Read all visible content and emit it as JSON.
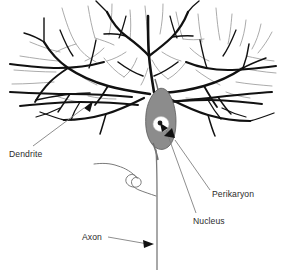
{
  "figure": {
    "background_color": "#ffffff",
    "ink_color": "#111111",
    "secondary_ink_color": "#9a9a9a",
    "soma_fill_color": "#8c8c8c",
    "soma_stroke_color": "#4a4a4a",
    "nucleus_fill_color": "#ffffff",
    "nucleolus_color": "#1a1a1a",
    "leader_line_color": "#707070",
    "label_color": "#2b2b2b"
  },
  "labels": [
    {
      "id": "dendrite",
      "text": "Dendrite",
      "x": 9,
      "y": 157,
      "anchor": "start",
      "points_to": "dendrite-branch"
    },
    {
      "id": "perikaryon",
      "text": "Perikaryon",
      "x": 212,
      "y": 197,
      "anchor": "start",
      "points_to": "cell-body"
    },
    {
      "id": "nucleus",
      "text": "Nucleus",
      "x": 193,
      "y": 224,
      "anchor": "start",
      "points_to": "nucleus-oval"
    },
    {
      "id": "axon",
      "text": "Axon",
      "x": 82,
      "y": 240,
      "anchor": "start",
      "points_to": "axon-fiber"
    }
  ],
  "parts": [
    {
      "id": "dendrite-canopy",
      "name": "Dendritic arbor"
    },
    {
      "id": "cell-body",
      "name": "Perikaryon (cell body)"
    },
    {
      "id": "nucleus-oval",
      "name": "Nucleus"
    },
    {
      "id": "axon-fiber",
      "name": "Axon"
    },
    {
      "id": "axon-collateral",
      "name": "Axon collateral"
    }
  ]
}
